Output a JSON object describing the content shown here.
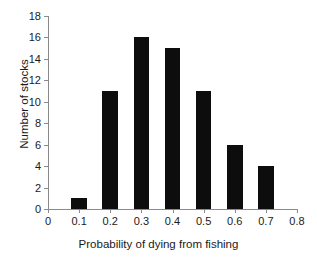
{
  "chart_data": {
    "type": "bar",
    "title": "",
    "xlabel": "Probability of dying from fishing",
    "ylabel": "Number of stocks",
    "categories": [
      "0.1",
      "0.2",
      "0.3",
      "0.4",
      "0.5",
      "0.6",
      "0.7"
    ],
    "values": [
      1,
      11,
      16,
      15,
      11,
      6,
      4
    ],
    "x": [
      0.1,
      0.2,
      0.3,
      0.4,
      0.5,
      0.6,
      0.7
    ],
    "xlim": [
      0,
      0.8
    ],
    "ylim": [
      0,
      18
    ],
    "x_ticks": [
      "0",
      "0.1",
      "0.2",
      "0.3",
      "0.4",
      "0.5",
      "0.6",
      "0.7",
      "0.8"
    ],
    "x_tick_values": [
      0,
      0.1,
      0.2,
      0.3,
      0.4,
      0.5,
      0.6,
      0.7,
      0.8
    ],
    "y_ticks": [
      "0",
      "2",
      "4",
      "6",
      "8",
      "10",
      "12",
      "14",
      "16",
      "18"
    ],
    "y_tick_values": [
      0,
      2,
      4,
      6,
      8,
      10,
      12,
      14,
      16,
      18
    ],
    "grid": false,
    "legend": false,
    "bar_color": "#0d0d0d",
    "axis_color": "#8a8a8a",
    "background_color": "#ffffff",
    "bar_width_fraction": 0.5
  }
}
